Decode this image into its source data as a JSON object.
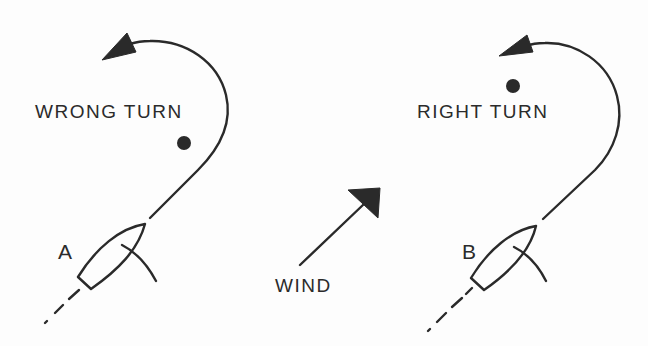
{
  "diagram": {
    "type": "sailing-maneuver",
    "left_panel": {
      "caption": "WRONG TURN",
      "boat_label": "A"
    },
    "center": {
      "wind_label": "WIND",
      "wind_direction": "toward upper-right (northeast)"
    },
    "right_panel": {
      "caption": "RIGHT TURN",
      "boat_label": "B"
    },
    "colors": {
      "ink": "#2a2a2a",
      "background": "#fdfdfd"
    }
  }
}
